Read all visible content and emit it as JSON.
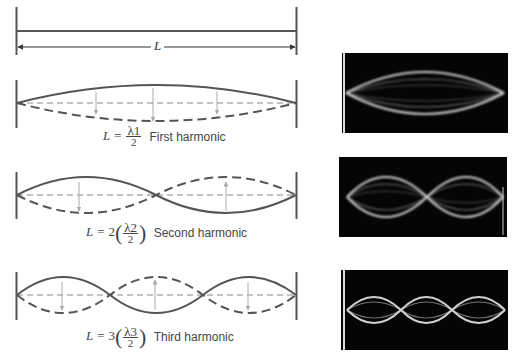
{
  "figure": {
    "length_label": "L",
    "colors": {
      "wall": "#555555",
      "string": "#555555",
      "arrow": "#aaaaaa",
      "photo_bg": "#050505",
      "photo_wave": "#e8e8e8"
    },
    "harmonics": [
      {
        "id": "first",
        "equation_prefix": "L =",
        "multiplier": "",
        "numerator": "λ1",
        "denominator": "2",
        "name": "First harmonic",
        "loops": 1
      },
      {
        "id": "second",
        "equation_prefix": "L = 2",
        "multiplier": "2",
        "numerator": "λ2",
        "denominator": "2",
        "name": "Second harmonic",
        "loops": 2
      },
      {
        "id": "third",
        "equation_prefix": "L = 3",
        "multiplier": "3",
        "numerator": "λ3",
        "denominator": "2",
        "name": "Third harmonic",
        "loops": 3
      }
    ]
  }
}
